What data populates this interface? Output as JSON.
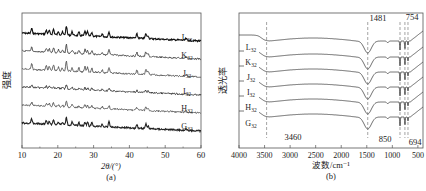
{
  "chart_data": [
    {
      "id": "a",
      "type": "line",
      "title": "",
      "caption": "(a)",
      "xlabel": "2θ/(°)",
      "ylabel": "强度",
      "xlim": [
        10,
        60
      ],
      "xticks": [
        10,
        20,
        30,
        40,
        50,
        60
      ],
      "grid": false,
      "legend_position": "inline-right",
      "series_labels": [
        {
          "name": "L",
          "sub": "32"
        },
        {
          "name": "K",
          "sub": "32"
        },
        {
          "name": "J",
          "sub": "32"
        },
        {
          "name": "I",
          "sub": "32"
        },
        {
          "name": "H",
          "sub": "32"
        },
        {
          "name": "G",
          "sub": "32"
        }
      ],
      "peaks_2theta": [
        12.7,
        16.8,
        17.6,
        18.8,
        20.2,
        21.3,
        22.4,
        24.0,
        25.9,
        27.6,
        28.3,
        29.5,
        32.4,
        34.3,
        42.1,
        44.6,
        45.2,
        55.8
      ],
      "peak_rel_heights": [
        0.55,
        0.45,
        0.4,
        0.6,
        0.35,
        0.3,
        1.0,
        0.4,
        0.35,
        0.5,
        0.45,
        0.4,
        0.3,
        0.6,
        0.45,
        0.55,
        0.35,
        0.2
      ],
      "series_intensity_scale": [
        1.0,
        0.95,
        1.1,
        0.45,
        0.7,
        0.9
      ]
    },
    {
      "id": "b",
      "type": "line",
      "title": "",
      "caption": "(b)",
      "xlabel": "波数/cm⁻¹",
      "ylabel": "透光率",
      "xlim": [
        4000,
        400
      ],
      "xticks": [
        4000,
        3500,
        3000,
        2500,
        2000,
        1500,
        1000,
        500
      ],
      "grid": false,
      "legend_position": "inline-left",
      "series_labels": [
        {
          "name": "L",
          "sub": "32"
        },
        {
          "name": "K",
          "sub": "32"
        },
        {
          "name": "J",
          "sub": "32"
        },
        {
          "name": "I",
          "sub": "32"
        },
        {
          "name": "H",
          "sub": "32"
        },
        {
          "name": "G",
          "sub": "32"
        }
      ],
      "annotations": [
        {
          "text": "3460",
          "x": 3460,
          "dashed_line": true
        },
        {
          "text": "1481",
          "x": 1481,
          "dashed_line": true
        },
        {
          "text": "850",
          "x": 850,
          "dashed_line": true
        },
        {
          "text": "754",
          "x": 754,
          "dashed_line": true
        },
        {
          "text": "694",
          "x": 694,
          "dashed_line": true
        }
      ],
      "bands_cm1": [
        3460,
        1481,
        1090,
        850,
        754,
        694
      ],
      "band_rel_depths": [
        0.25,
        1.0,
        0.1,
        0.6,
        0.55,
        0.35
      ]
    }
  ]
}
